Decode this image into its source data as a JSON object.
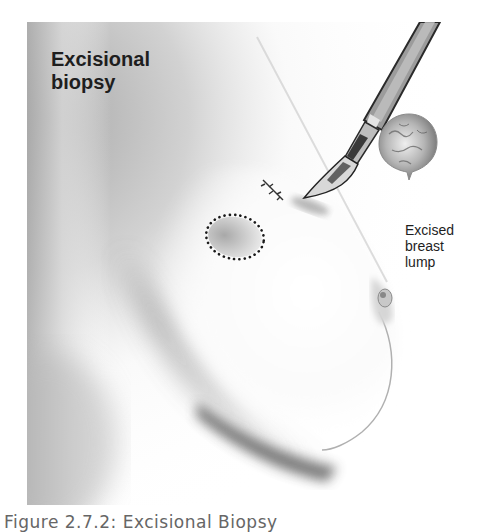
{
  "figure": {
    "title_lines": [
      "Excisional",
      "biopsy"
    ],
    "lump_label_lines": [
      "Excised",
      "breast",
      "lump"
    ],
    "caption": "Figure 2.7.2: Excisional Biopsy",
    "elements": {
      "scalpel": "scalpel-icon",
      "incision": "sutured-incision",
      "lump_outline": "dotted-ellipse-outline",
      "excised_lump": "excised-lump-mass"
    },
    "colors": {
      "text": "#1e1e1e",
      "caption": "#666666",
      "shading_dark": "#555555",
      "background": "#ffffff"
    }
  }
}
